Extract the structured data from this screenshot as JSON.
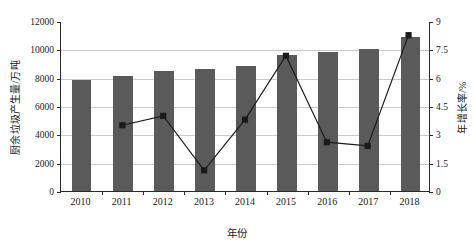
{
  "chart_data": {
    "type": "bar",
    "title": "",
    "xlabel": "年份",
    "ylabel": "厨余垃圾产生量/万吨",
    "y2label": "年增长率/%",
    "categories": [
      "2010",
      "2011",
      "2012",
      "2013",
      "2014",
      "2015",
      "2016",
      "2017",
      "2018"
    ],
    "ylim": [
      0,
      12000
    ],
    "y2lim": [
      0,
      9
    ],
    "yticks": [
      "0",
      "2000",
      "4000",
      "6000",
      "8000",
      "10000",
      "12000"
    ],
    "y2ticks": [
      "0",
      "1.5",
      "3",
      "4.5",
      "6",
      "7.5",
      "9"
    ],
    "grid": true,
    "legend": "none",
    "series": [
      {
        "name": "厨余垃圾产生量/万吨",
        "type": "bar",
        "axis": "left",
        "color": "#5a5a5a",
        "values": [
          7870,
          8120,
          8500,
          8600,
          8840,
          9580,
          9800,
          10020,
          10880
        ]
      },
      {
        "name": "年增长率/%",
        "type": "line",
        "axis": "right",
        "color": "#1a1a1a",
        "marker": "square",
        "values": [
          null,
          3.5,
          4.0,
          1.1,
          3.8,
          7.2,
          2.6,
          2.4,
          8.3
        ]
      }
    ]
  },
  "axis": {
    "x_title": "年份",
    "y_left_title": "厨余垃圾产生量/万吨",
    "y_right_title": "年增长率/%"
  }
}
